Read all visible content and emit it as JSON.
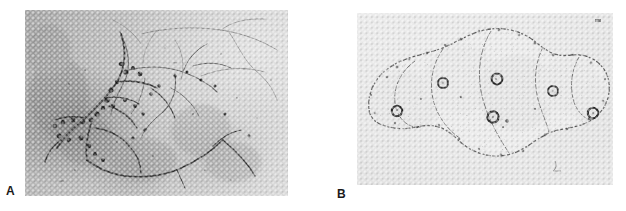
{
  "figure": {
    "type": "two-panel-micrograph",
    "background_color": "#ffffff",
    "width": 626,
    "height": 211,
    "panels": [
      {
        "id": "A",
        "label": "A",
        "label_x": 6,
        "label_y": 185,
        "x": 25,
        "y": 10,
        "width": 263,
        "height": 186,
        "subject": "branching fungal hyphae with conidia",
        "description": "Dark branching filamentous hyphae bearing round spores spread across a mottled grey phase-contrast field with a darker cloudy region at the left.",
        "background_tone": "#b8b8b8",
        "filament_color": "#1e1e1e",
        "spore_color": "#121212",
        "halftone": true
      },
      {
        "id": "B",
        "label": "B",
        "label_x": 337,
        "label_y": 188,
        "x": 357,
        "y": 13,
        "width": 256,
        "height": 172,
        "subject": "chain of epithelial cells with ring nuclei",
        "description": "A horizontal chain of five to six large pale epithelial cells with dark ring-shaped nuclei and finely granular speckled cytoplasm on a light background.",
        "background_tone": "#e8e8e8",
        "outline_color": "#3a3a3a",
        "nucleus_color": "#1a1a1a",
        "halftone": true
      }
    ]
  },
  "panel_a_content": {
    "hyphae_count": 16,
    "conidia_count": 34,
    "dark_cloud_region": "left-center",
    "focus_note": "thick dark hyphae lower-left, thin faint hyphae upper-right"
  },
  "panel_b_content": {
    "cell_count": 6,
    "nuclei_count": 6,
    "arrangement": "horizontal overlapping chain",
    "cytoplasm_texture": "granular stippling"
  }
}
